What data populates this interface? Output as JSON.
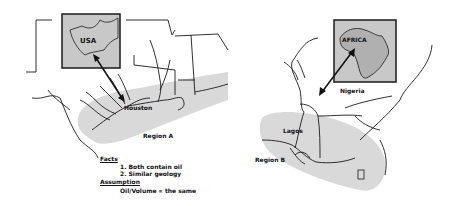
{
  "left_map": {
    "inset_label": "USA",
    "city_label": "Houston",
    "region_label": "Region A"
  },
  "right_map": {
    "inset_label": "AFRICA",
    "country_label": "Nigeria",
    "city_label": "Lagos",
    "region_label": "Region B"
  },
  "notes": {
    "facts_heading": "Facts",
    "facts": [
      "1. Both contain oil",
      "2. Similar geology"
    ],
    "assumption_heading": "Assumption",
    "assumption_text": "Oil/Volume ∝ the same"
  },
  "colors": {
    "shading": "#d9d9d9",
    "inset_fill": "#c8c8c8",
    "line": "#1a1a1a"
  }
}
